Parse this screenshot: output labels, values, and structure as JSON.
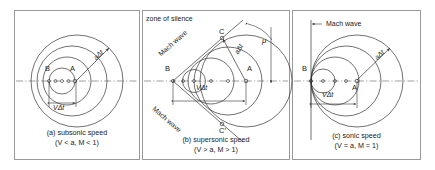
{
  "figure": {
    "background": "#ffffff",
    "line_color": "#333333",
    "frame_color": "#9a9a9a",
    "axis_style": "dash-dot centerline"
  },
  "panels": [
    {
      "id": "a",
      "caption_line1": "(a) subsonic speed",
      "caption_line2": "(V < a, M < 1)",
      "points": {
        "source_now": "A",
        "source_past": "B"
      },
      "labels": {
        "radius": "aΔt",
        "distance": "VΔt"
      },
      "condition": {
        "velocity": "V < a",
        "mach": "M < 1"
      },
      "wave_count": 4
    },
    {
      "id": "b",
      "caption_line1": "(b) supersonic speed",
      "caption_line2": "(V > a, M > 1)",
      "points": {
        "source_now": "A",
        "source_past": "B",
        "tangent_top": "C",
        "tangent_bottom": "C′"
      },
      "labels": {
        "radius": "aΔt",
        "distance": "VΔt",
        "zone": "zone of silence",
        "mach_wave_top": "Mach wave",
        "mach_wave_bottom": "Mach wave",
        "mach_angle": "μ"
      },
      "condition": {
        "velocity": "V > a",
        "mach": "M > 1"
      },
      "wave_count": 4
    },
    {
      "id": "c",
      "caption_line1": "(c) sonic speed",
      "caption_line2": "(V = a, M = 1)",
      "points": {
        "source_now": "A",
        "source_past": "B"
      },
      "labels": {
        "radius": "aΔt",
        "distance": "VΔt",
        "mach_wave": "Mach wave"
      },
      "condition": {
        "velocity": "V = a",
        "mach": "M = 1"
      },
      "wave_count": 4
    }
  ]
}
